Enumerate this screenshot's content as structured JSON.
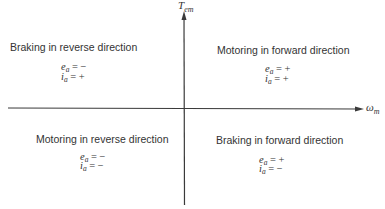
{
  "diagram": {
    "type": "four-quadrant operation",
    "axes": {
      "vertical": {
        "symbol": "T",
        "subscript": "em"
      },
      "horizontal": {
        "symbol": "ω",
        "subscript": "m"
      }
    },
    "quadrants": {
      "top_left": {
        "title": "Braking in reverse direction",
        "e_sign": "−",
        "i_sign": "+"
      },
      "top_right": {
        "title": "Motoring in forward direction",
        "e_sign": "+",
        "i_sign": "+"
      },
      "bottom_left": {
        "title": "Motoring in reverse direction",
        "e_sign": "−",
        "i_sign": "−"
      },
      "bottom_right": {
        "title": "Braking in forward direction",
        "e_sign": "+",
        "i_sign": "−"
      }
    },
    "eq_labels": {
      "e": "e",
      "i": "i",
      "sub": "a",
      "equals": "="
    },
    "colors": {
      "line": "#3a3a3a",
      "text": "#333333"
    }
  }
}
